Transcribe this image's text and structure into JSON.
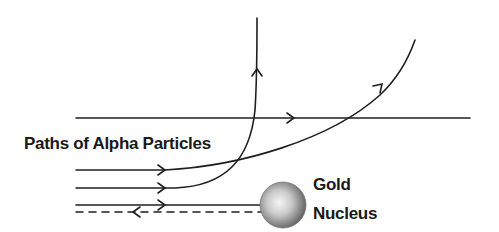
{
  "diagram": {
    "title": "Paths of Alpha Particles",
    "nucleus": {
      "label_line1": "Gold",
      "label_line2": "Nucleus",
      "color_center": "#f4f4f4",
      "color_edge": "#6b6b6b"
    },
    "paths": [
      {
        "id": "straight-through",
        "description": "Passes straight through, undeflected",
        "direction": "right"
      },
      {
        "id": "slight-deflection",
        "description": "Slightly deflected upward to the right",
        "direction": "up-right"
      },
      {
        "id": "large-deflection",
        "description": "Strongly deflected, travels vertically upward",
        "direction": "up"
      },
      {
        "id": "head-on-rebound",
        "description": "Heads toward nucleus and rebounds back (dashed)",
        "direction": "left"
      }
    ],
    "line_color": "#1f1f1f"
  }
}
